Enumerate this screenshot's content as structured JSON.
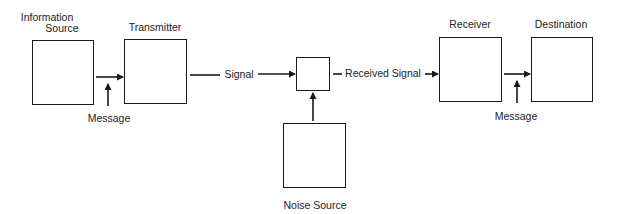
{
  "diagram": {
    "type": "communication-system-block-diagram",
    "blocks": [
      {
        "id": "information-source",
        "label_line1": "Information",
        "label_line2": "Source"
      },
      {
        "id": "transmitter",
        "label": "Transmitter"
      },
      {
        "id": "noise-junction",
        "label": ""
      },
      {
        "id": "noise-source",
        "label": "Noise Source"
      },
      {
        "id": "receiver",
        "label": "Receiver"
      },
      {
        "id": "destination",
        "label": "Destination"
      }
    ],
    "edges": [
      {
        "from": "information-source",
        "to": "transmitter",
        "annotation": "Message"
      },
      {
        "from": "transmitter",
        "to": "noise-junction",
        "label": "Signal"
      },
      {
        "from": "noise-source",
        "to": "noise-junction",
        "label": ""
      },
      {
        "from": "noise-junction",
        "to": "receiver",
        "label": "Received Signal"
      },
      {
        "from": "receiver",
        "to": "destination",
        "annotation": "Message"
      }
    ],
    "labels": {
      "info_source_1": "Information",
      "info_source_2": "Source",
      "transmitter": "Transmitter",
      "receiver": "Receiver",
      "destination": "Destination",
      "noise_source": "Noise Source",
      "message_left": "Message",
      "message_right": "Message",
      "signal": "Signal",
      "received_signal": "Received Signal"
    },
    "colors": {
      "line": "#1a1a1a",
      "background": "#ffffff"
    }
  }
}
